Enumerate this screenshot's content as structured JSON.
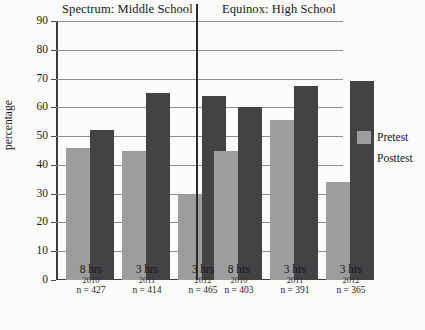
{
  "chart_data": {
    "type": "bar",
    "title": "",
    "xlabel": "",
    "ylabel": "percentage",
    "ylim": [
      0,
      90
    ],
    "ytick_step": 10,
    "yticks": [
      90,
      80,
      70,
      60,
      50,
      40,
      30,
      20,
      10,
      0
    ],
    "grid": true,
    "legend_position": "right",
    "panels": [
      {
        "title": "Spectrum: Middle School",
        "categories": [
          {
            "hours": "8 hrs",
            "year": "2010",
            "n": "n = 427"
          },
          {
            "hours": "3 hrs",
            "year": "2011",
            "n": "n = 414"
          },
          {
            "hours": "3 hrs",
            "year": "2012",
            "n": "n = 465"
          }
        ],
        "series": [
          {
            "name": "Pretest",
            "values": [
              46,
              45,
              30
            ]
          },
          {
            "name": "Posttest",
            "values": [
              52,
              65,
              64
            ]
          }
        ]
      },
      {
        "title": "Equinox: High School",
        "categories": [
          {
            "hours": "8 hrs",
            "year": "2010",
            "n": "n = 403"
          },
          {
            "hours": "3 hrs",
            "year": "2011",
            "n": "n = 391"
          },
          {
            "hours": "3 hrs",
            "year": "2012",
            "n": "n = 365"
          }
        ],
        "series": [
          {
            "name": "Pretest",
            "values": [
              45,
              55.5,
              34
            ]
          },
          {
            "name": "Posttest",
            "values": [
              60,
              67.5,
              69
            ]
          }
        ]
      }
    ],
    "legend": [
      {
        "label": "Pretest",
        "color": "#9d9d9d"
      },
      {
        "label": "Posttest",
        "color": "#434345"
      }
    ]
  }
}
